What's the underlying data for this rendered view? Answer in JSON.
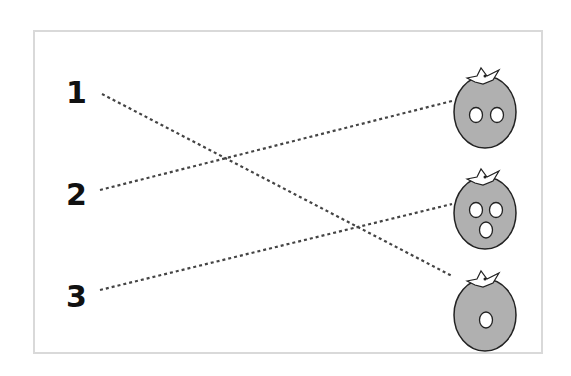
{
  "numbers": [
    "1",
    "2",
    "3"
  ],
  "tomatoes": [
    {
      "name": "two-eyes",
      "features": 2
    },
    {
      "name": "two-eyes-mouth",
      "features": 3
    },
    {
      "name": "one-hole",
      "features": 1
    }
  ],
  "connections": [
    {
      "from": "1",
      "to_tomato": 3
    },
    {
      "from": "2",
      "to_tomato": 1
    },
    {
      "from": "3",
      "to_tomato": 2
    }
  ],
  "colors": {
    "tomato_fill": "#b0b0b0",
    "outline": "#222222",
    "line": "#444444",
    "frame": "#d9d9d9"
  }
}
